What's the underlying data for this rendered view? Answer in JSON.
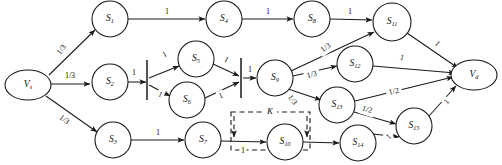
{
  "figure": {
    "kind": "directed-graph",
    "title": "",
    "width": 502,
    "height": 165,
    "background": "#ffffff",
    "ink": "#1a1a1a"
  },
  "nodes": [
    {
      "id": "Vs",
      "label": "V",
      "sub": "s",
      "shape": "ellipse",
      "cx": 28,
      "cy": 85,
      "rx": 23,
      "ry": 15
    },
    {
      "id": "S1",
      "label": "S",
      "sub": "1",
      "shape": "circle",
      "cx": 110,
      "cy": 19,
      "rx": 18,
      "ry": 18
    },
    {
      "id": "S2",
      "label": "S",
      "sub": "2",
      "shape": "circle",
      "cx": 110,
      "cy": 82,
      "rx": 18,
      "ry": 18
    },
    {
      "id": "S3",
      "label": "S",
      "sub": "3",
      "shape": "circle",
      "cx": 113,
      "cy": 140,
      "rx": 18,
      "ry": 18
    },
    {
      "id": "S4",
      "label": "S",
      "sub": "4",
      "shape": "circle",
      "cx": 224,
      "cy": 19,
      "rx": 18,
      "ry": 18
    },
    {
      "id": "S5",
      "label": "S",
      "sub": "5",
      "shape": "circle",
      "cx": 196,
      "cy": 59,
      "rx": 18,
      "ry": 18
    },
    {
      "id": "S6",
      "label": "S",
      "sub": "6",
      "shape": "circle",
      "cx": 187,
      "cy": 100,
      "rx": 18,
      "ry": 18
    },
    {
      "id": "S7",
      "label": "S",
      "sub": "7",
      "shape": "circle",
      "cx": 203,
      "cy": 140,
      "rx": 18,
      "ry": 18
    },
    {
      "id": "S8",
      "label": "S",
      "sub": "8",
      "shape": "circle",
      "cx": 312,
      "cy": 19,
      "rx": 18,
      "ry": 18
    },
    {
      "id": "S9",
      "label": "S",
      "sub": "9",
      "shape": "circle",
      "cx": 275,
      "cy": 78,
      "rx": 18,
      "ry": 18
    },
    {
      "id": "S10",
      "label": "S",
      "sub": "10",
      "shape": "circle",
      "cx": 285,
      "cy": 142,
      "rx": 18,
      "ry": 18
    },
    {
      "id": "S11",
      "label": "S",
      "sub": "11",
      "shape": "circle",
      "cx": 392,
      "cy": 22,
      "rx": 19,
      "ry": 19
    },
    {
      "id": "S12",
      "label": "S",
      "sub": "12",
      "shape": "circle",
      "cx": 355,
      "cy": 64,
      "rx": 18,
      "ry": 18
    },
    {
      "id": "S13",
      "label": "S",
      "sub": "13",
      "shape": "circle",
      "cx": 337,
      "cy": 105,
      "rx": 18,
      "ry": 18
    },
    {
      "id": "S14",
      "label": "S",
      "sub": "14",
      "shape": "circle",
      "cx": 358,
      "cy": 143,
      "rx": 18,
      "ry": 18
    },
    {
      "id": "S15",
      "label": "S",
      "sub": "15",
      "shape": "circle",
      "cx": 414,
      "cy": 126,
      "rx": 18,
      "ry": 18
    },
    {
      "id": "Vd",
      "label": "V",
      "sub": "d",
      "shape": "ellipse",
      "cx": 474,
      "cy": 75,
      "rx": 23,
      "ry": 15
    }
  ],
  "bars": [
    {
      "id": "bar-split-1",
      "x": 147,
      "y1": 60,
      "y2": 100
    },
    {
      "id": "bar-join-1",
      "x": 241,
      "y1": 58,
      "y2": 98
    }
  ],
  "edges": [
    {
      "id": "e-vs-s1",
      "from": "Vs",
      "to": "S1",
      "label": "1/3",
      "lx": 62,
      "ly": 50,
      "rot": -52,
      "x1": 49,
      "y1": 75,
      "x2": 95,
      "y2": 30
    },
    {
      "id": "e-vs-s2",
      "from": "Vs",
      "to": "S2",
      "label": "1/3",
      "lx": 70,
      "ly": 76,
      "rot": 0,
      "x1": 51,
      "y1": 84,
      "x2": 90,
      "y2": 84
    },
    {
      "id": "e-vs-s3",
      "from": "Vs",
      "to": "S3",
      "label": "1/3",
      "lx": 64,
      "ly": 120,
      "rot": 38,
      "x1": 46,
      "y1": 96,
      "x2": 97,
      "y2": 132
    },
    {
      "id": "e-s1-s4",
      "from": "S1",
      "to": "S4",
      "label": "1",
      "lx": 167,
      "ly": 12,
      "rot": 0,
      "x1": 128,
      "y1": 19,
      "x2": 205,
      "y2": 19
    },
    {
      "id": "e-s4-s8",
      "from": "S4",
      "to": "S8",
      "label": "1",
      "lx": 268,
      "ly": 12,
      "rot": 0,
      "x1": 242,
      "y1": 19,
      "x2": 293,
      "y2": 19
    },
    {
      "id": "e-s8-s11",
      "from": "S8",
      "to": "S11",
      "label": "1",
      "lx": 350,
      "ly": 12,
      "rot": 0,
      "x1": 330,
      "y1": 19,
      "x2": 372,
      "y2": 20
    },
    {
      "id": "e-s2-bar",
      "from": "S2",
      "to": "bar-split-1",
      "label": "1",
      "lx": 134,
      "ly": 73,
      "rot": 0,
      "x1": 128,
      "y1": 82,
      "x2": 146,
      "y2": 82
    },
    {
      "id": "e-bar-s5",
      "from": "bar-split-1",
      "to": "S5",
      "label": "1",
      "lx": 165,
      "ly": 55,
      "rot": -28,
      "x1": 149,
      "y1": 78,
      "x2": 179,
      "y2": 66
    },
    {
      "id": "e-bar-s6",
      "from": "bar-split-1",
      "to": "S6",
      "label": "1",
      "lx": 160,
      "ly": 95,
      "rot": 26,
      "x1": 149,
      "y1": 85,
      "x2": 170,
      "y2": 96
    },
    {
      "id": "e-s5-join",
      "from": "S5",
      "to": "bar-join-1",
      "label": "1",
      "lx": 226,
      "ly": 60,
      "rot": 28,
      "x1": 213,
      "y1": 64,
      "x2": 239,
      "y2": 76
    },
    {
      "id": "e-s6-join",
      "from": "S6",
      "to": "bar-join-1",
      "label": "1",
      "lx": 221,
      "ly": 96,
      "rot": -22,
      "x1": 205,
      "y1": 98,
      "x2": 239,
      "y2": 82
    },
    {
      "id": "e-join-s9",
      "from": "bar-join-1",
      "to": "S9",
      "label": "1",
      "lx": 250,
      "ly": 70,
      "rot": 0,
      "x1": 243,
      "y1": 78,
      "x2": 256,
      "y2": 78
    },
    {
      "id": "e-s3-s7",
      "from": "S3",
      "to": "S7",
      "label": "1",
      "lx": 158,
      "ly": 133,
      "rot": 0,
      "x1": 131,
      "y1": 140,
      "x2": 184,
      "y2": 140
    },
    {
      "id": "e-s7-s10",
      "from": "S7",
      "to": "S10",
      "label": "1",
      "lx": 243,
      "ly": 151,
      "rot": 0,
      "x1": 221,
      "y1": 141,
      "x2": 266,
      "y2": 142
    },
    {
      "id": "e-s9-s11",
      "from": "S9",
      "to": "S11",
      "label": "1/3",
      "lx": 326,
      "ly": 48,
      "rot": -35,
      "x1": 291,
      "y1": 71,
      "x2": 374,
      "y2": 32
    },
    {
      "id": "e-s9-s12",
      "from": "S9",
      "to": "S12",
      "label": "1/3",
      "lx": 312,
      "ly": 75,
      "rot": -16,
      "x1": 293,
      "y1": 76,
      "x2": 337,
      "y2": 66
    },
    {
      "id": "e-s9-s13",
      "from": "S9",
      "to": "S13",
      "label": "1/3",
      "lx": 292,
      "ly": 100,
      "rot": 54,
      "x1": 288,
      "y1": 89,
      "x2": 321,
      "y2": 100
    },
    {
      "id": "e-s11-vd",
      "from": "S11",
      "to": "Vd",
      "label": "1",
      "lx": 437,
      "ly": 44,
      "rot": 44,
      "x1": 407,
      "y1": 33,
      "x2": 458,
      "y2": 68
    },
    {
      "id": "e-s12-vd",
      "from": "S12",
      "to": "Vd",
      "label": "1",
      "lx": 402,
      "ly": 58,
      "rot": 16,
      "x1": 373,
      "y1": 66,
      "x2": 455,
      "y2": 73
    },
    {
      "id": "e-s13-vd",
      "from": "S13",
      "to": "Vd",
      "label": "1/2",
      "lx": 394,
      "ly": 92,
      "rot": -12,
      "x1": 355,
      "y1": 101,
      "x2": 453,
      "y2": 77
    },
    {
      "id": "e-s13-s15",
      "from": "S13",
      "to": "S15",
      "label": "1/2",
      "lx": 367,
      "ly": 110,
      "rot": 18,
      "x1": 354,
      "y1": 112,
      "x2": 396,
      "y2": 124
    },
    {
      "id": "e-s10-s14",
      "from": "S10",
      "to": "S14",
      "label": "",
      "lx": 0,
      "ly": 0,
      "rot": 0,
      "x1": 303,
      "y1": 142,
      "x2": 339,
      "y2": 143
    },
    {
      "id": "e-s14-s15",
      "from": "S14",
      "to": "S15",
      "label": "1",
      "lx": 389,
      "ly": 137,
      "rot": -42,
      "x1": 373,
      "y1": 134,
      "x2": 399,
      "y2": 137
    },
    {
      "id": "e-s15-vd",
      "from": "S15",
      "to": "Vd",
      "label": "1",
      "lx": 447,
      "ly": 102,
      "rot": -48,
      "x1": 429,
      "y1": 116,
      "x2": 456,
      "y2": 86
    }
  ],
  "regions": [
    {
      "id": "region-K",
      "label": "K",
      "x": 231,
      "y": 112,
      "width": 79,
      "height": 38,
      "label_x": 270,
      "label_y": 112
    }
  ],
  "region_arrows": [
    {
      "id": "k-arrow-left",
      "x1": 234,
      "y1": 116,
      "x2": 234,
      "y2": 137
    },
    {
      "id": "k-arrow-right",
      "x1": 307,
      "y1": 116,
      "x2": 307,
      "y2": 137
    }
  ]
}
